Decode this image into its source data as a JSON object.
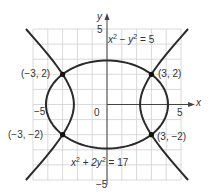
{
  "axes": {
    "x_label": "x",
    "y_label": "y",
    "origin_label": "0",
    "x_min_label": "−5",
    "x_max_label": "5",
    "y_min_label": "−5",
    "y_max_label": "5",
    "range": {
      "x": [
        -5,
        5
      ],
      "y": [
        -5,
        5
      ]
    },
    "grid": true
  },
  "curves": [
    {
      "name": "hyperbola",
      "equation_lhs_a": "x",
      "equation_lhs_b": "y",
      "equation_rhs": "5",
      "equation": "x² − y² = 5"
    },
    {
      "name": "ellipse",
      "equation_lhs_a": "x",
      "equation_lhs_b": "2y",
      "equation_rhs": "17",
      "equation": "x² + 2y² = 17"
    }
  ],
  "points": [
    {
      "label": "(−3, 2)",
      "x": -3,
      "y": 2
    },
    {
      "label": "(3, 2)",
      "x": 3,
      "y": 2
    },
    {
      "label": "(−3, −2)",
      "x": -3,
      "y": -2
    },
    {
      "label": "(3, −2)",
      "x": 3,
      "y": -2
    }
  ],
  "colors": {
    "curve": "#2a2a2a",
    "grid": "#cfcfcf",
    "axis": "#444444",
    "text": "#333333"
  }
}
